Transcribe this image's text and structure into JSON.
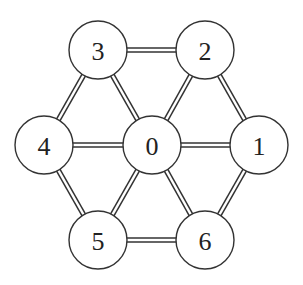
{
  "graph": {
    "nodes": [
      {
        "id": "0",
        "label": "0",
        "x": 152,
        "y": 145
      },
      {
        "id": "1",
        "label": "1",
        "x": 259,
        "y": 145
      },
      {
        "id": "2",
        "label": "2",
        "x": 205,
        "y": 50
      },
      {
        "id": "3",
        "label": "3",
        "x": 98,
        "y": 50
      },
      {
        "id": "4",
        "label": "4",
        "x": 44,
        "y": 145
      },
      {
        "id": "5",
        "label": "5",
        "x": 98,
        "y": 240
      },
      {
        "id": "6",
        "label": "6",
        "x": 205,
        "y": 240
      }
    ],
    "edges": [
      [
        "3",
        "2"
      ],
      [
        "2",
        "1"
      ],
      [
        "1",
        "6"
      ],
      [
        "6",
        "5"
      ],
      [
        "5",
        "4"
      ],
      [
        "4",
        "3"
      ],
      [
        "0",
        "1"
      ],
      [
        "0",
        "2"
      ],
      [
        "0",
        "3"
      ],
      [
        "0",
        "4"
      ],
      [
        "0",
        "5"
      ],
      [
        "0",
        "6"
      ]
    ],
    "node_radius": 29,
    "edge_style": "double-line"
  }
}
